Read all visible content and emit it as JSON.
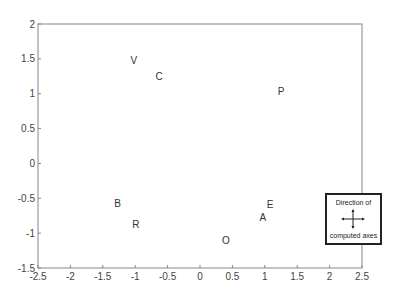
{
  "chart_data": {
    "type": "scatter",
    "title": "",
    "xlabel": "",
    "ylabel": "",
    "xlim": [
      -2.5,
      2.5
    ],
    "ylim": [
      -1.5,
      2
    ],
    "grid": false,
    "x_ticks": [
      "-2.5",
      "-2",
      "-1.5",
      "-1",
      "-0.5",
      "0",
      "0.5",
      "1",
      "1.5",
      "2",
      "2.5"
    ],
    "y_ticks": [
      "-1.5",
      "-1",
      "-0.5",
      "0",
      "0.5",
      "1",
      "1.5",
      "2"
    ],
    "points": [
      {
        "label": "V",
        "x": -1.02,
        "y": 1.48
      },
      {
        "label": "C",
        "x": -0.63,
        "y": 1.25
      },
      {
        "label": "P",
        "x": 1.25,
        "y": 1.03
      },
      {
        "label": "B",
        "x": -1.27,
        "y": -0.57
      },
      {
        "label": "R",
        "x": -0.99,
        "y": -0.88
      },
      {
        "label": "E",
        "x": 1.08,
        "y": -0.59
      },
      {
        "label": "A",
        "x": 0.97,
        "y": -0.77
      },
      {
        "label": "O",
        "x": 0.4,
        "y": -1.1
      }
    ],
    "legend": {
      "title": "Direction of",
      "footer": "computed axes",
      "icon": "four-way-arrow-cross",
      "position": "lower-right, overlapping right border"
    }
  },
  "legend": {
    "title": "Direction of",
    "footer": "computed axes"
  }
}
